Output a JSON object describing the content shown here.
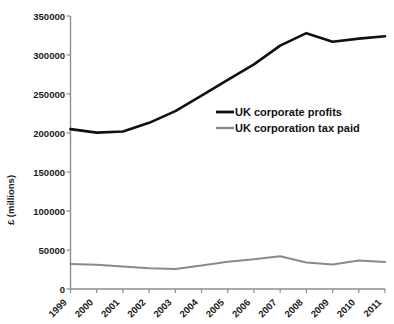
{
  "chart_data": {
    "type": "line",
    "title": "",
    "xlabel": "",
    "ylabel": "£ (millions)",
    "x": [
      1999,
      2000,
      2001,
      2002,
      2003,
      2004,
      2005,
      2006,
      2007,
      2008,
      2009,
      2010,
      2011
    ],
    "xtick_labels": [
      "1999",
      "2000",
      "2001",
      "2002",
      "2003",
      "2004",
      "2005",
      "2006",
      "2007",
      "2008",
      "2009",
      "2010",
      "2011"
    ],
    "ytick_labels": [
      "0",
      "50000",
      "100000",
      "150000",
      "200000",
      "250000",
      "300000",
      "350000"
    ],
    "ytick_values": [
      0,
      50000,
      100000,
      150000,
      200000,
      250000,
      300000,
      350000
    ],
    "ylim": [
      0,
      350000
    ],
    "xlim": [
      1999,
      2011
    ],
    "grid": false,
    "legend_position": "center-right",
    "series": [
      {
        "name": "UK corporate profits",
        "color": "#111111",
        "values": [
          205000,
          200500,
          202000,
          213000,
          228000,
          248000,
          268000,
          288000,
          312000,
          328000,
          317000,
          321000,
          324000
        ]
      },
      {
        "name": "UK corporation tax paid",
        "color": "#8a8a8a",
        "values": [
          32000,
          31000,
          29000,
          26500,
          25500,
          30000,
          35000,
          38000,
          42000,
          34000,
          31500,
          36500,
          34500
        ]
      }
    ]
  },
  "legend": {
    "items": [
      {
        "label": "UK corporate profits",
        "color": "#111111"
      },
      {
        "label": "UK corporation tax paid",
        "color": "#8a8a8a"
      }
    ]
  },
  "axes": {
    "y_title": "£ (millions)"
  }
}
